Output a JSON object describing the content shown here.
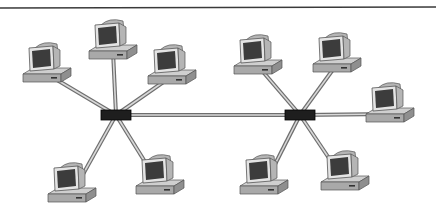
{
  "diagram": {
    "type": "network-topology",
    "colors": {
      "background": "#ffffff",
      "rule": "#3a3a3a",
      "cable_outer": "#6e6e6e",
      "cable_inner": "#d8d8d8",
      "hub": "#1e1e1e",
      "monitor_body": "#e4e4e4",
      "monitor_side": "#b5b5b5",
      "screen": "#3c3c3c",
      "base_top": "#cfcfcf",
      "base_front": "#a9a9a9"
    },
    "hubs": [
      {
        "id": "hub-left",
        "x": 116,
        "y": 115
      },
      {
        "id": "hub-right",
        "x": 300,
        "y": 115
      }
    ],
    "computers": [
      {
        "id": "pc-l1",
        "hub": "hub-left",
        "x": 47,
        "y": 70
      },
      {
        "id": "pc-l2",
        "hub": "hub-left",
        "x": 113,
        "y": 47
      },
      {
        "id": "pc-l3",
        "hub": "hub-left",
        "x": 172,
        "y": 72
      },
      {
        "id": "pc-l4",
        "hub": "hub-left",
        "x": 72,
        "y": 190
      },
      {
        "id": "pc-l5",
        "hub": "hub-left",
        "x": 160,
        "y": 182
      },
      {
        "id": "pc-r1",
        "hub": "hub-right",
        "x": 258,
        "y": 62
      },
      {
        "id": "pc-r2",
        "hub": "hub-right",
        "x": 337,
        "y": 60
      },
      {
        "id": "pc-r3",
        "hub": "hub-right",
        "x": 390,
        "y": 110
      },
      {
        "id": "pc-r4",
        "hub": "hub-right",
        "x": 264,
        "y": 182
      },
      {
        "id": "pc-r5",
        "hub": "hub-right",
        "x": 345,
        "y": 178
      }
    ],
    "links": [
      {
        "from": "hub-left",
        "to": "hub-right"
      }
    ]
  }
}
